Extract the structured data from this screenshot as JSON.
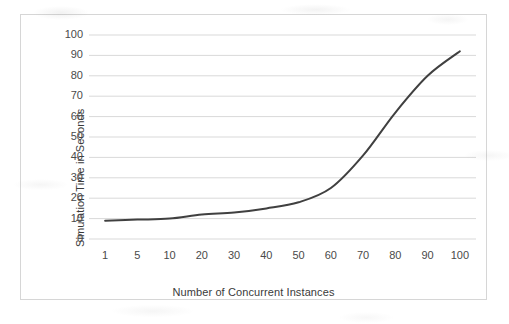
{
  "chart_data": {
    "type": "line",
    "title": "",
    "xlabel": "Number of Concurrent Instances",
    "ylabel": "Simulation Time in Seconds",
    "categories": [
      "1",
      "5",
      "10",
      "20",
      "30",
      "40",
      "50",
      "60",
      "70",
      "80",
      "90",
      "100"
    ],
    "values": [
      9,
      9.5,
      10,
      12,
      13,
      15,
      18,
      25,
      41,
      62,
      80,
      92
    ],
    "series": [
      {
        "name": "Simulation Time",
        "values": [
          9,
          9.5,
          10,
          12,
          13,
          15,
          18,
          25,
          41,
          62,
          80,
          92
        ],
        "color": "#404040"
      }
    ],
    "ylim": [
      0,
      100
    ],
    "y_ticks": [
      0,
      10,
      20,
      30,
      40,
      50,
      60,
      70,
      80,
      90,
      100
    ],
    "y_tick_labels": [
      "0",
      "10",
      "20",
      "30",
      "40",
      "50",
      "60",
      "70",
      "80",
      "90",
      "100"
    ],
    "x_tick_labels": [
      "1",
      "5",
      "10",
      "20",
      "30",
      "40",
      "50",
      "60",
      "70",
      "80",
      "90",
      "100"
    ],
    "grid": true,
    "grid_axis": "y",
    "legend": false,
    "legend_position": "none",
    "line_width": 2,
    "markers": false
  },
  "colors": {
    "line": "#404040",
    "gridline": "#d9d9d9",
    "border": "#d6d6d6",
    "tick_text": "#4a4a4a",
    "axis_title_text": "#3a3a3a",
    "plot_background": "#ffffff"
  }
}
